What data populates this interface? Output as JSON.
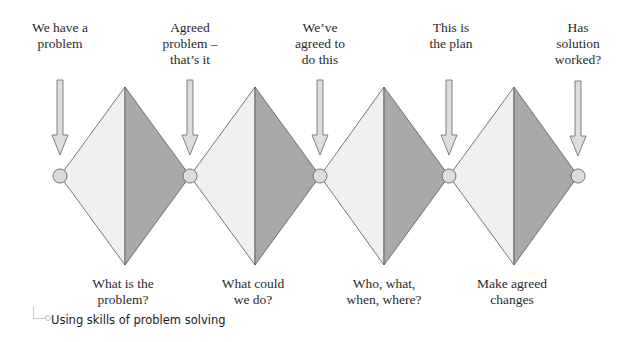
{
  "colors": {
    "diamond_light": "#f0f0f0",
    "diamond_dark": "#a9a9a9",
    "node_fill": "#dcdcdc",
    "arrow_fill": "#dddddd",
    "stroke": "#555555"
  },
  "top_labels": [
    {
      "line1": "We have a",
      "line2": "problem",
      "line3": ""
    },
    {
      "line1": "Agreed",
      "line2": "problem –",
      "line3": "that’s it"
    },
    {
      "line1": "We’ve",
      "line2": "agreed to",
      "line3": "do this"
    },
    {
      "line1": "This is",
      "line2": "the plan",
      "line3": ""
    },
    {
      "line1": "Has",
      "line2": "solution",
      "line3": "worked?"
    }
  ],
  "bottom_labels": [
    {
      "line1": "What is the",
      "line2": "problem?"
    },
    {
      "line1": "What could",
      "line2": "we do?"
    },
    {
      "line1": "Who, what,",
      "line2": "when, where?"
    },
    {
      "line1": "Make agreed",
      "line2": "changes"
    }
  ],
  "caption": "Using skills of problem solving"
}
